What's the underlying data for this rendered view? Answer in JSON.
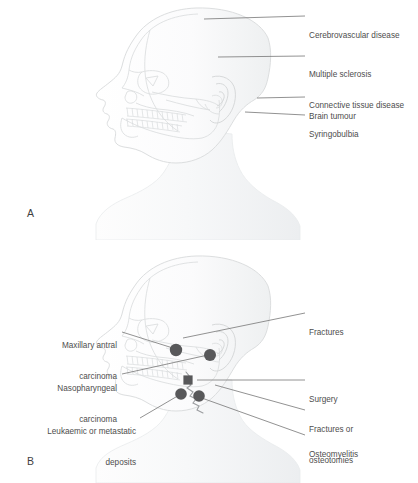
{
  "figure": {
    "type": "anatomical-illustration",
    "background_color": "#ffffff",
    "line_color": "#d8dadb",
    "label_text_color": "#4d4d4d",
    "leader_line_color": "#6e6e6e",
    "marker_color": "#58585a"
  },
  "panel_a": {
    "letter": "A",
    "subject": "lateral view of head with skull overlay",
    "labels": [
      {
        "id": "cerebrovascular-disease",
        "lines": [
          "Cerebrovascular disease"
        ],
        "side": "right",
        "x": 309,
        "y": 11,
        "leader": {
          "x1": 204,
          "y1": 19,
          "x2": 305,
          "y2": 16
        }
      },
      {
        "id": "multiple-sclerosis",
        "lines": [
          "Multiple sclerosis",
          "Connective tissue disease"
        ],
        "side": "right",
        "x": 309,
        "y": 50,
        "leader": {
          "x1": 218,
          "y1": 57,
          "x2": 305,
          "y2": 56
        }
      },
      {
        "id": "brain-tumour",
        "lines": [
          "Brain tumour"
        ],
        "side": "right",
        "x": 309,
        "y": 92,
        "leader": {
          "x1": 257,
          "y1": 98,
          "x2": 305,
          "y2": 97
        }
      },
      {
        "id": "syringobulbia",
        "lines": [
          "Syringobulbia"
        ],
        "side": "right",
        "x": 309,
        "y": 110,
        "leader": {
          "x1": 245,
          "y1": 112,
          "x2": 305,
          "y2": 115
        }
      }
    ]
  },
  "panel_b": {
    "letter": "B",
    "subject": "lateral view of head with skull overlay and lesion site markers",
    "labels": [
      {
        "id": "fractures",
        "lines": [
          "Fractures"
        ],
        "side": "right",
        "x": 309,
        "y": 308,
        "leader": {
          "x1": 183,
          "y1": 338,
          "x2": 305,
          "y2": 313
        }
      },
      {
        "id": "maxillary-antral-carcinoma",
        "lines": [
          "Maxillary antral",
          "carcinoma"
        ],
        "side": "left",
        "x": 117,
        "y": 326,
        "leader": {
          "x1": 122,
          "y1": 332,
          "x2": 176,
          "y2": 349
        }
      },
      {
        "id": "nasopharyngeal-carcinoma",
        "lines": [
          "Nasopharyngeal",
          "carcinoma"
        ],
        "side": "left",
        "x": 117,
        "y": 369,
        "leader": {
          "x1": 122,
          "y1": 374,
          "x2": 208,
          "y2": 355
        }
      },
      {
        "id": "surgery",
        "lines": [
          "Surgery"
        ],
        "side": "right",
        "x": 309,
        "y": 375,
        "leader": {
          "x1": 197,
          "y1": 380,
          "x2": 305,
          "y2": 380
        }
      },
      {
        "id": "fractures-or-osteotomies",
        "lines": [
          "Fractures or",
          "osteotomies"
        ],
        "side": "right",
        "x": 309,
        "y": 405,
        "leader": {
          "x1": 215,
          "y1": 385,
          "x2": 305,
          "y2": 410
        }
      },
      {
        "id": "leukaemic-or-metastatic-deposits",
        "lines": [
          "Leukaemic or metastatic",
          "deposits"
        ],
        "side": "left",
        "x": 136,
        "y": 412,
        "leader": {
          "x1": 140,
          "y1": 418,
          "x2": 181,
          "y2": 394
        }
      },
      {
        "id": "osteomyelitis",
        "lines": [
          "Osteomyelitis"
        ],
        "side": "right",
        "x": 309,
        "y": 432,
        "leader": {
          "x1": 199,
          "y1": 397,
          "x2": 305,
          "y2": 435
        }
      }
    ],
    "markers": [
      {
        "id": "marker-maxillary-antrum",
        "shape": "circle",
        "cx": 176,
        "cy": 350,
        "r": 6.2
      },
      {
        "id": "marker-nasopharynx",
        "shape": "circle",
        "cx": 210,
        "cy": 355,
        "r": 6.0
      },
      {
        "id": "marker-mandible-body",
        "shape": "square",
        "cx": 188,
        "cy": 380,
        "r": 4.6
      },
      {
        "id": "marker-mandible-angle-left",
        "shape": "circle",
        "cx": 181,
        "cy": 394,
        "r": 5.8
      },
      {
        "id": "marker-mandible-angle-right",
        "shape": "circle",
        "cx": 199,
        "cy": 396,
        "r": 5.8
      }
    ]
  }
}
